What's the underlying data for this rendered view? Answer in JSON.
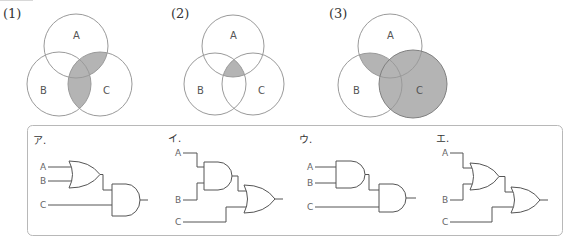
{
  "colors": {
    "shade": "#b4b4b4",
    "circle_stroke": "#9a9a9a",
    "gate_stroke": "#555555",
    "box_stroke": "#b8b8b8"
  },
  "venn_diagrams": [
    {
      "label": "(1)",
      "shaded_region": "C ∩ (A ∪ B)",
      "circles": [
        {
          "name": "A",
          "cx": 76,
          "cy": 46,
          "r": 32
        },
        {
          "name": "B",
          "cx": 59,
          "cy": 84,
          "r": 32
        },
        {
          "name": "C",
          "cx": 100,
          "cy": 84,
          "r": 32
        }
      ]
    },
    {
      "label": "(2)",
      "shaded_region": "A ∩ B ∩ C",
      "circles": [
        {
          "name": "A",
          "cx": 233,
          "cy": 46,
          "r": 31
        },
        {
          "name": "B",
          "cx": 215,
          "cy": 84,
          "r": 31
        },
        {
          "name": "C",
          "cx": 253,
          "cy": 84,
          "r": 31
        }
      ]
    },
    {
      "label": "(3)",
      "shaded_region": "(A ∩ B) ∪ C",
      "circles": [
        {
          "name": "A",
          "cx": 390,
          "cy": 46,
          "r": 32
        },
        {
          "name": "B",
          "cx": 370,
          "cy": 85,
          "r": 32
        },
        {
          "name": "C",
          "cx": 413,
          "cy": 84,
          "r": 34
        }
      ]
    }
  ],
  "circuits": [
    {
      "option": "ア.",
      "expression": "(A OR B) AND C",
      "inputs": [
        "A",
        "B",
        "C"
      ]
    },
    {
      "option": "イ.",
      "expression": "(A AND B) OR C",
      "inputs": [
        "A",
        "B",
        "C"
      ]
    },
    {
      "option": "ウ.",
      "expression": "(A AND B) AND C",
      "inputs": [
        "A",
        "B",
        "C"
      ]
    },
    {
      "option": "エ.",
      "expression": "(A OR B) OR C",
      "inputs": [
        "A",
        "B",
        "C"
      ]
    }
  ]
}
